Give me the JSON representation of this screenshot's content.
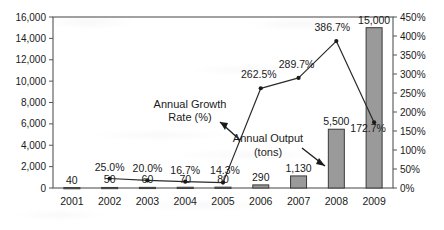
{
  "chart_data": {
    "type": "bar",
    "title": "",
    "subtitle": "",
    "xlabel": "",
    "ylabel": "",
    "y2label": "",
    "grid": false,
    "legend_position": "none",
    "categories": [
      "2001",
      "2002",
      "2003",
      "2004",
      "2005",
      "2006",
      "2007",
      "2008",
      "2009"
    ],
    "series": [
      {
        "name": "Annual Output (tons)",
        "type": "bar",
        "axis": "left",
        "values": [
          40,
          50,
          60,
          70,
          80,
          290,
          1130,
          5500,
          15000
        ],
        "value_labels": [
          "40",
          "50",
          "60",
          "70",
          "80",
          "290",
          "1,130",
          "5,500",
          "15,000"
        ],
        "fill_color": "#9a9a9a",
        "border_color": "#3a3a3a"
      },
      {
        "name": "Annual Growth Rate (%)",
        "type": "line",
        "axis": "right",
        "values": [
          null,
          25.0,
          20.0,
          16.7,
          14.3,
          262.5,
          289.7,
          386.7,
          172.7
        ],
        "value_labels": [
          "",
          "25.0%",
          "20.0%",
          "16.7%",
          "14.3%",
          "262.5%",
          "289.7%",
          "386.7%",
          "172.7%"
        ],
        "line_color": "#2a2a2a",
        "marker_color": "#1a1a1a"
      }
    ],
    "ylim": [
      0,
      16000
    ],
    "y_ticks": [
      0,
      2000,
      4000,
      6000,
      8000,
      10000,
      12000,
      14000,
      16000
    ],
    "y_tick_labels": [
      "0",
      "2,000",
      "4,000",
      "6,000",
      "8,000",
      "10,000",
      "12,000",
      "14,000",
      "16,000"
    ],
    "y2lim": [
      0,
      450
    ],
    "y2_ticks": [
      0,
      50,
      100,
      150,
      200,
      250,
      300,
      350,
      400,
      450
    ],
    "y2_tick_labels": [
      "0%",
      "50%",
      "100%",
      "150%",
      "200%",
      "250%",
      "300%",
      "350%",
      "400%",
      "450%"
    ],
    "annotations": [
      {
        "id": "growth-rate-annotation",
        "line1": "Annual Growth",
        "line2": "Rate (%)"
      },
      {
        "id": "output-annotation",
        "line1": "Annual Output",
        "line2": "(tons)"
      }
    ],
    "colors": {
      "bar_fill": "#9a9a9a",
      "bar_border": "#3a3a3a",
      "line": "#2a2a2a",
      "axis": "#555555",
      "text": "#1a1a1a",
      "background": "#ffffff"
    }
  }
}
